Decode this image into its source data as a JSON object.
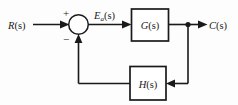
{
  "diagram": {
    "signals": {
      "input": {
        "base": "R",
        "subscript": "",
        "arg": "(s)",
        "full": "R(s)"
      },
      "error": {
        "base": "E",
        "subscript": "a",
        "arg": "(s)",
        "full": "Ea(s)"
      },
      "output": {
        "base": "C",
        "subscript": "",
        "arg": "(s)",
        "full": "C(s)"
      }
    },
    "blocks": [
      {
        "id": "forward-block",
        "base": "G",
        "arg": "(s)",
        "full": "G(s)",
        "role": "forward-path-transfer-function"
      },
      {
        "id": "feedback-block",
        "base": "H",
        "arg": "(s)",
        "full": "H(s)",
        "role": "feedback-path-transfer-function"
      }
    ],
    "summing_junction": {
      "positive_sign": "+",
      "negative_sign": "−",
      "positive_input": "R(s)",
      "negative_input": "H(s)"
    },
    "colors": {
      "line": "#1a1a1a",
      "block_fill": "#ffffff",
      "background": "#fdfdfd",
      "text": "#1a1a1a"
    }
  }
}
